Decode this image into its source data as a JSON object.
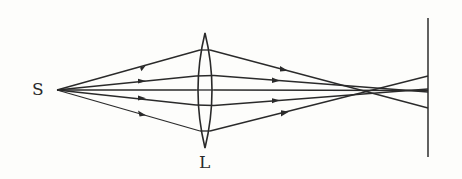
{
  "diagram": {
    "title": "",
    "type": "optics-ray-diagram",
    "labels": {
      "source": "S",
      "lens": "L"
    },
    "elements": [
      {
        "id": "source",
        "label": "S",
        "kind": "point-source"
      },
      {
        "id": "lens",
        "label": "L",
        "kind": "biconvex-lens"
      },
      {
        "id": "screen",
        "label": "",
        "kind": "screen"
      }
    ],
    "rays": {
      "count": 5,
      "direction": "left-to-right",
      "arrows_before_lens": 4,
      "arrows_after_lens": 4
    },
    "colors": {
      "line": "#2a2a2a",
      "background": "#fdfdfb"
    }
  }
}
